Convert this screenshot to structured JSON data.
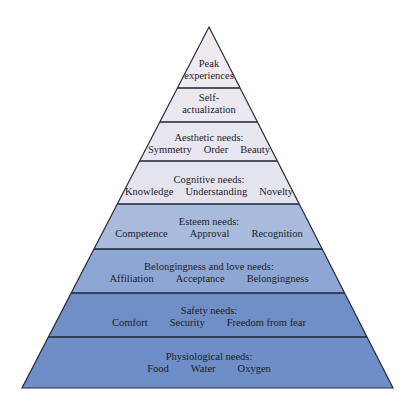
{
  "diagram": {
    "type": "pyramid",
    "apex": [
      209,
      27
    ],
    "base_left": [
      22,
      388
    ],
    "base_right": [
      393,
      388
    ],
    "layers": [
      {
        "name": "peak-experiences",
        "title": "Peak experiences",
        "title_lines": [
          "Peak",
          "experiences"
        ],
        "items": [],
        "y_top": 27,
        "y_bottom": 88,
        "fill": "#efeaf0",
        "label_y": 58
      },
      {
        "name": "self-actualization",
        "title": "Self-actualization",
        "title_lines": [
          "Self-",
          "actualization"
        ],
        "items": [],
        "y_top": 88,
        "y_bottom": 122,
        "fill": "#ece8ef",
        "label_y": 92
      },
      {
        "name": "aesthetic-needs",
        "title": "Aesthetic needs:",
        "title_lines": [
          "Aesthetic needs:"
        ],
        "items": [
          "Symmetry",
          "Order",
          "Beauty"
        ],
        "y_top": 122,
        "y_bottom": 161,
        "fill": "#e8e6ef",
        "label_y": 132
      },
      {
        "name": "cognitive-needs",
        "title": "Cognitive needs:",
        "title_lines": [
          "Cognitive needs:"
        ],
        "items": [
          "Knowledge",
          "Understanding",
          "Novelty"
        ],
        "y_top": 161,
        "y_bottom": 204,
        "fill": "#e4e4ee",
        "label_y": 174
      },
      {
        "name": "esteem-needs",
        "title": "Esteem needs:",
        "title_lines": [
          "Esteem needs:"
        ],
        "items": [
          "Competence",
          "Approval",
          "Recognition"
        ],
        "y_top": 204,
        "y_bottom": 249,
        "fill": "#a9bbdc",
        "label_y": 216
      },
      {
        "name": "belongingness-and-love-needs",
        "title": "Belongingness and love needs:",
        "title_lines": [
          "Belongingness and love needs:"
        ],
        "items": [
          "Affiliation",
          "Acceptance",
          "Belongingness"
        ],
        "y_top": 249,
        "y_bottom": 293,
        "fill": "#8ea6d3",
        "label_y": 261
      },
      {
        "name": "safety-needs",
        "title": "Safety needs:",
        "title_lines": [
          "Safety needs:"
        ],
        "items": [
          "Comfort",
          "Security",
          "Freedom from fear"
        ],
        "y_top": 293,
        "y_bottom": 337,
        "fill": "#6f8fc6",
        "label_y": 305
      },
      {
        "name": "physiological-needs",
        "title": "Physiological needs:",
        "title_lines": [
          "Physiological needs:"
        ],
        "items": [
          "Food",
          "Water",
          "Oxygen"
        ],
        "y_top": 337,
        "y_bottom": 388,
        "fill": "#6d8ec7",
        "label_y": 351
      }
    ],
    "outline_color": "#2a2a3a",
    "divider_color": "#1e2236",
    "text_color": "#1c1c2a"
  }
}
